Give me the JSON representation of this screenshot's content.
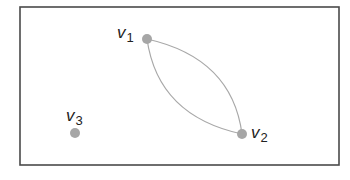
{
  "diagram": {
    "type": "graph",
    "frame": {
      "x": 20,
      "y": 7,
      "width": 319,
      "height": 158,
      "color": "#4a4a4a"
    },
    "node_color": "#a6a6a6",
    "edge_color": "#a8a8a8",
    "node_radius": 5,
    "nodes": [
      {
        "id": "v1",
        "base": "v",
        "sub": "1",
        "x": 147,
        "y": 39,
        "label_x": 118,
        "label_y": 23
      },
      {
        "id": "v2",
        "base": "v",
        "sub": "2",
        "x": 242,
        "y": 134,
        "label_x": 251,
        "label_y": 125
      },
      {
        "id": "v3",
        "base": "v",
        "sub": "3",
        "x": 75,
        "y": 133,
        "label_x": 66,
        "label_y": 107
      }
    ],
    "edges": [
      {
        "from": "v1",
        "to": "v2",
        "curve": "upper-right"
      },
      {
        "from": "v1",
        "to": "v2",
        "curve": "lower-left"
      }
    ]
  }
}
